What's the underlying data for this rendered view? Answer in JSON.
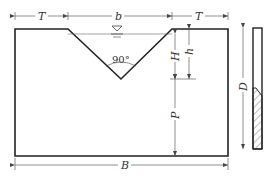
{
  "diagram": {
    "type": "V-notch (90°) thin-plate weir",
    "labels": {
      "T": "T",
      "b": "b",
      "H": "H",
      "h": "h",
      "P": "P",
      "D": "D",
      "B": "B",
      "angle": "90°"
    },
    "colors": {
      "line": "#222222",
      "dim": "#444444",
      "background": "#ffffff"
    }
  }
}
